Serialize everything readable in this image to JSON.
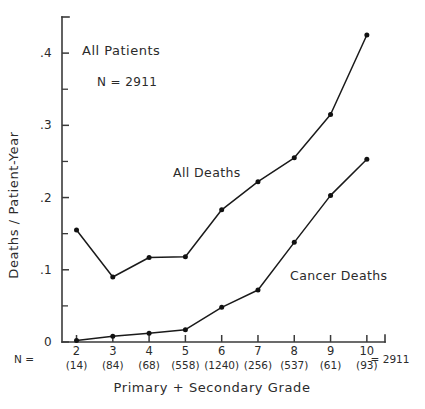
{
  "chart_data": {
    "type": "line",
    "title": "",
    "xlabel": "Primary + Secondary Grade",
    "ylabel": "Deaths / Patient-Year",
    "x": [
      2,
      3,
      4,
      5,
      6,
      7,
      8,
      9,
      10
    ],
    "xtick_labels": [
      "2",
      "3",
      "4",
      "5",
      "6",
      "7",
      "8",
      "9",
      "10"
    ],
    "xlim": [
      1.6,
      10.5
    ],
    "ylim": [
      0,
      0.45
    ],
    "ytick_labels": [
      "0",
      ".1",
      ".2",
      ".3",
      ".4"
    ],
    "ytick_values": [
      0,
      0.1,
      0.2,
      0.3,
      0.4
    ],
    "yminor_values": [
      0.05,
      0.15,
      0.25,
      0.35
    ],
    "grid": false,
    "legend": "inline-annotations",
    "series": [
      {
        "name": "All Deaths",
        "values": [
          0.155,
          0.09,
          0.117,
          0.118,
          0.183,
          0.222,
          0.255,
          0.315,
          0.425
        ]
      },
      {
        "name": "Cancer Deaths",
        "values": [
          0.002,
          0.008,
          0.012,
          0.017,
          0.048,
          0.072,
          0.138,
          0.203,
          0.253
        ]
      }
    ],
    "annotations": {
      "group_title": "All Patients",
      "group_n": "N = 2911",
      "series_label_all": "All Deaths",
      "series_label_cancer": "Cancer Deaths"
    },
    "n_row": {
      "prefix": "N =",
      "counts": [
        "(14)",
        "(84)",
        "(68)",
        "(558)",
        "(1240)",
        "(256)",
        "(537)",
        "(61)",
        "(93)"
      ],
      "total": "= 2911"
    },
    "colors": {
      "line": "#1a1a1a",
      "axis": "#3a3a3a",
      "text": "#2b2b2b",
      "background": "#ffffff"
    }
  }
}
